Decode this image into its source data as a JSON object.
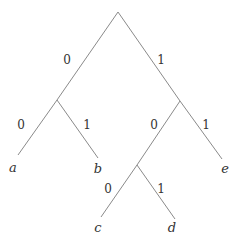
{
  "diagram": {
    "type": "binary-tree",
    "colors": {
      "edge": "#8a8a8a",
      "text": "#333333",
      "background": "#ffffff"
    },
    "nodes": {
      "root": {
        "x": 118,
        "y": 12
      },
      "n0": {
        "x": 57,
        "y": 100
      },
      "n1": {
        "x": 180,
        "y": 101
      },
      "n10": {
        "x": 137,
        "y": 165
      },
      "a": {
        "x": 18,
        "y": 155
      },
      "b": {
        "x": 98,
        "y": 158
      },
      "c": {
        "x": 101,
        "y": 217
      },
      "d": {
        "x": 175,
        "y": 219
      },
      "e": {
        "x": 222,
        "y": 159
      }
    },
    "edges": [
      {
        "from": "root",
        "to": "n0",
        "label": "0",
        "lx": 67,
        "ly": 64
      },
      {
        "from": "root",
        "to": "n1",
        "label": "1",
        "lx": 161,
        "ly": 64
      },
      {
        "from": "n0",
        "to": "a",
        "label": "0",
        "lx": 21,
        "ly": 129
      },
      {
        "from": "n0",
        "to": "b",
        "label": "1",
        "lx": 87,
        "ly": 129
      },
      {
        "from": "n1",
        "to": "n10",
        "label": "0",
        "lx": 154,
        "ly": 129
      },
      {
        "from": "n1",
        "to": "e",
        "label": "1",
        "lx": 206,
        "ly": 129
      },
      {
        "from": "n10",
        "to": "c",
        "label": "0",
        "lx": 108,
        "ly": 193
      },
      {
        "from": "n10",
        "to": "d",
        "label": "1",
        "lx": 161,
        "ly": 193
      }
    ],
    "leaves": [
      {
        "id": "a",
        "label": "a",
        "lx": 13,
        "ly": 172
      },
      {
        "id": "b",
        "label": "b",
        "lx": 98,
        "ly": 173
      },
      {
        "id": "c",
        "label": "c",
        "lx": 98,
        "ly": 232
      },
      {
        "id": "d",
        "label": "d",
        "lx": 172,
        "ly": 232
      },
      {
        "id": "e",
        "label": "e",
        "lx": 225,
        "ly": 173
      }
    ]
  }
}
